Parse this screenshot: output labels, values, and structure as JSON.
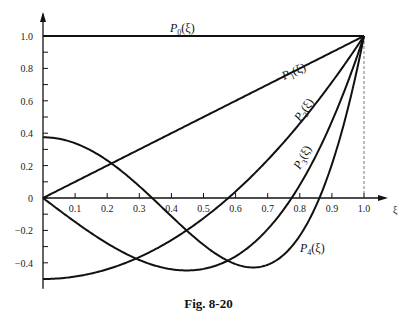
{
  "chart_data": {
    "type": "line",
    "title": "",
    "caption": "Fig. 8-20",
    "xlabel": "ξ",
    "ylabel": "",
    "xlim": [
      0,
      1.0
    ],
    "ylim": [
      -0.5,
      1.0
    ],
    "grid": false,
    "x_ticks": [
      "0.1",
      "0.2",
      "0.3",
      "0.4",
      "0.5",
      "0.6",
      "0.7",
      "0.8",
      "0.9",
      "1.0"
    ],
    "y_ticks": [
      "1.0",
      "0.8",
      "0.6",
      "0.4",
      "0.2",
      "0",
      "-0.2",
      "-0.4"
    ],
    "x": [
      0,
      0.1,
      0.2,
      0.3,
      0.4,
      0.5,
      0.6,
      0.7,
      0.8,
      0.9,
      1.0
    ],
    "series": [
      {
        "name": "P0(ξ)",
        "label_sub": "0",
        "values": [
          1,
          1,
          1,
          1,
          1,
          1,
          1,
          1,
          1,
          1,
          1
        ]
      },
      {
        "name": "P1(ξ)",
        "label_sub": "1",
        "values": [
          0,
          0.1,
          0.2,
          0.3,
          0.4,
          0.5,
          0.6,
          0.7,
          0.8,
          0.9,
          1.0
        ]
      },
      {
        "name": "P2(ξ)",
        "label_sub": "2",
        "values": [
          -0.5,
          -0.485,
          -0.44,
          -0.365,
          -0.26,
          -0.125,
          0.04,
          0.235,
          0.46,
          0.715,
          1.0
        ]
      },
      {
        "name": "P3(ξ)",
        "label_sub": "3",
        "values": [
          0,
          -0.1475,
          -0.28,
          -0.3825,
          -0.44,
          -0.4375,
          -0.36,
          -0.1925,
          0.08,
          0.4725,
          1.0
        ]
      },
      {
        "name": "P4(ξ)",
        "label_sub": "4",
        "values": [
          0.375,
          0.3379,
          0.232,
          0.0729,
          -0.113,
          -0.2891,
          -0.408,
          -0.4121,
          -0.233,
          0.2079,
          1.0
        ]
      }
    ],
    "annotations": [
      "dashed vertical line at ξ = 1.0"
    ]
  },
  "figure": {
    "caption": "Fig. 8-20",
    "axis_symbol": "ξ",
    "label_prefix": "P",
    "label_arg": "(ξ)"
  }
}
